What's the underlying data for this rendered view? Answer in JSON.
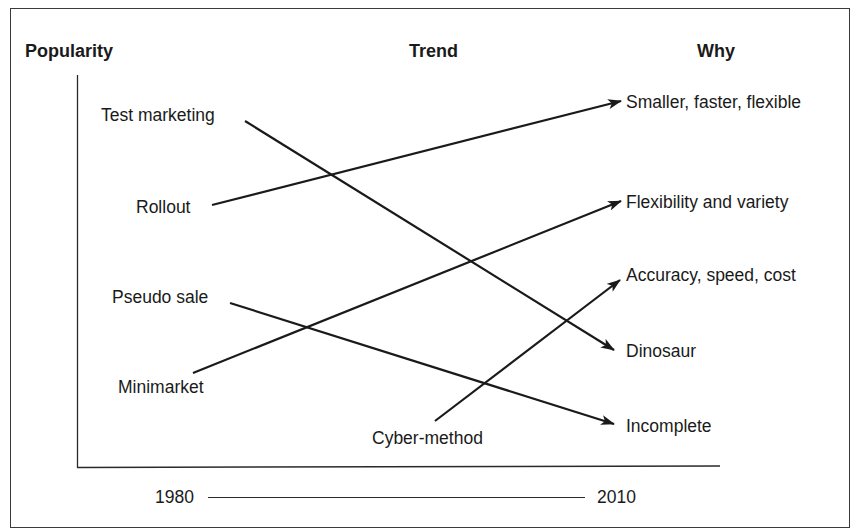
{
  "headers": {
    "popularity": "Popularity",
    "trend": "Trend",
    "why": "Why"
  },
  "methods": [
    {
      "label": "Test marketing",
      "x": 101,
      "y": 105
    },
    {
      "label": "Rollout",
      "x": 136,
      "y": 197
    },
    {
      "label": "Pseudo sale",
      "x": 112,
      "y": 287
    },
    {
      "label": "Minimarket",
      "x": 118,
      "y": 377
    },
    {
      "label": "Cyber-method",
      "x": 372,
      "y": 428
    }
  ],
  "reasons": [
    {
      "label": "Smaller, faster, flexible",
      "x": 626,
      "y": 92
    },
    {
      "label": "Flexibility and variety",
      "x": 626,
      "y": 192
    },
    {
      "label": "Accuracy, speed, cost",
      "x": 626,
      "y": 265
    },
    {
      "label": "Dinosaur",
      "x": 626,
      "y": 341
    },
    {
      "label": "Incomplete",
      "x": 626,
      "y": 416
    }
  ],
  "links": [
    {
      "from": "Test marketing",
      "to": "Dinosaur",
      "x1": 245,
      "y1": 121,
      "x2": 614,
      "y2": 350
    },
    {
      "from": "Rollout",
      "to": "Smaller, faster, flexible",
      "x1": 212,
      "y1": 205,
      "x2": 621,
      "y2": 101
    },
    {
      "from": "Pseudo sale",
      "to": "Incomplete",
      "x1": 230,
      "y1": 303,
      "x2": 614,
      "y2": 424
    },
    {
      "from": "Minimarket",
      "to": "Flexibility and variety",
      "x1": 193,
      "y1": 373,
      "x2": 621,
      "y2": 201
    },
    {
      "from": "Cyber-method",
      "to": "Accuracy, speed, cost",
      "x1": 435,
      "y1": 421,
      "x2": 620,
      "y2": 280
    }
  ],
  "timeline": {
    "start": "1980",
    "end": "2010"
  },
  "colors": {
    "ink": "#1a1a1a",
    "frame": "#3a3a3a",
    "background": "#ffffff"
  }
}
